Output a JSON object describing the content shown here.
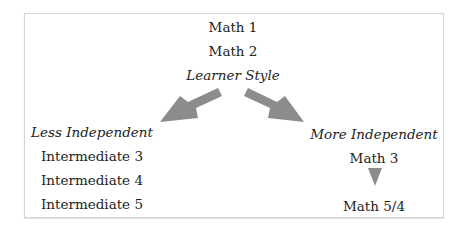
{
  "diagram": {
    "top": {
      "items": [
        "Math 1",
        "Math 2"
      ],
      "branch_label": "Learner Style"
    },
    "left_branch": {
      "heading": "Less Independent",
      "items": [
        "Intermediate 3",
        "Intermediate 4",
        "Intermediate 5"
      ]
    },
    "right_branch": {
      "heading": "More Independent",
      "items": [
        "Math 3",
        "Math 5/4"
      ]
    },
    "colors": {
      "arrow": "#8c8c8c",
      "border": "#d4d4d4",
      "text": "#222222"
    }
  }
}
